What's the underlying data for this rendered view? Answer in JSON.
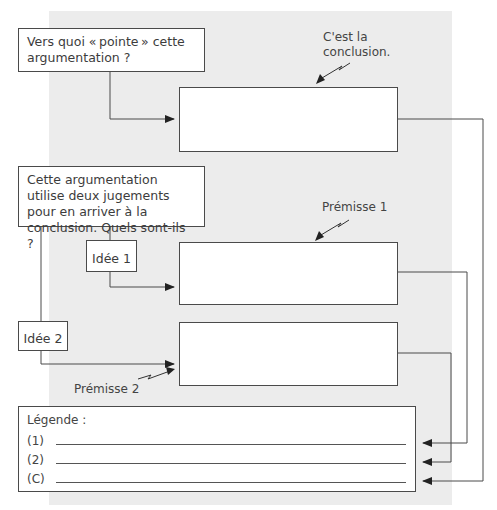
{
  "diagram": {
    "question_conclusion": "Vers quoi « pointe » cette argumentation ?",
    "question_premises": "Cette argumentation utilise deux jugements pour en arriver à la conclusion. Quels sont-ils ?",
    "idea1_label": "Idée 1",
    "idea2_label": "Idée 2",
    "conclusion_note": "C'est la conclusion.",
    "premise1_note": "Prémisse 1",
    "premise2_note": "Prémisse 2",
    "conclusion_answer": "",
    "premise1_answer": "",
    "premise2_answer": ""
  },
  "legend": {
    "title": "Légende :",
    "rows": [
      {
        "key": "(1)",
        "value": ""
      },
      {
        "key": "(2)",
        "value": ""
      },
      {
        "key": "(C)",
        "value": ""
      }
    ]
  },
  "colors": {
    "background_panel": "#ececec",
    "line": "#4a4a4a",
    "box_fill": "#ffffff"
  }
}
